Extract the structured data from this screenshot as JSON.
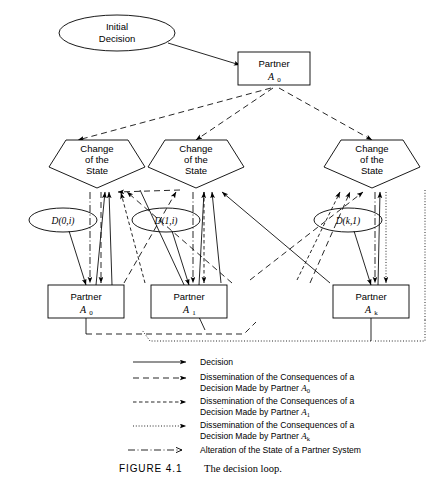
{
  "figure": {
    "label": "FIGURE 4.1",
    "caption": "The decision loop."
  },
  "nodes": {
    "initial_decision": {
      "line1": "Initial",
      "line2": "Decision"
    },
    "top_partner": {
      "line1": "Partner",
      "sub_base": "A",
      "sub_index": "0"
    },
    "change_of_state": {
      "line1": "Change",
      "line2": "of the",
      "line3": "State"
    },
    "bottom_partners": [
      {
        "line1": "Partner",
        "sub_base": "A",
        "sub_index": "0"
      },
      {
        "line1": "Partner",
        "sub_base": "A",
        "sub_index": "1"
      },
      {
        "line1": "Partner",
        "sub_base": "A",
        "sub_index": "k"
      }
    ],
    "decision_ellipses": [
      {
        "label": "D(0,i)"
      },
      {
        "label": "D(1,i)"
      },
      {
        "label": "D(k,1)"
      }
    ]
  },
  "legend": {
    "items": [
      {
        "style": "solid",
        "line1": "Decision",
        "line2": "",
        "sub_base": "",
        "sub_index": ""
      },
      {
        "style": "dash-a0",
        "line1": "Dissemination of the Consequences of a",
        "line2": "Decision Made by Partner ",
        "sub_base": "A",
        "sub_index": "0"
      },
      {
        "style": "dash-a1",
        "line1": "Dissemination of the Consequences of a",
        "line2": "Decision Made by Partner ",
        "sub_base": "A",
        "sub_index": "1"
      },
      {
        "style": "dot-ak",
        "line1": "Dissemination of the Consequences of a",
        "line2": "Decision Made by Partner ",
        "sub_base": "A",
        "sub_index": "k"
      },
      {
        "style": "dashdot",
        "line1": "Alteration of the State of a Partner System",
        "line2": "",
        "sub_base": "",
        "sub_index": ""
      }
    ]
  },
  "colors": {
    "stroke": "#000000",
    "fill": "#ffffff",
    "background": "#ffffff"
  }
}
